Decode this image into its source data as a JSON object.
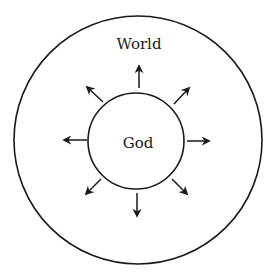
{
  "diagram": {
    "outer_label": "World",
    "inner_label": "God",
    "stroke_color": "#1a1a1a",
    "background": "#ffffff",
    "arrow_count": 8,
    "arrow_directions": [
      "up",
      "up-right",
      "right",
      "down-right",
      "down",
      "down-left",
      "left",
      "up-left"
    ]
  }
}
